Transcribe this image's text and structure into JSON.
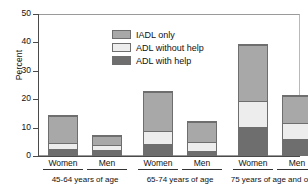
{
  "chart_data": {
    "type": "bar",
    "subtype": "stacked-grouped-bar",
    "title": "",
    "xlabel": "",
    "ylabel": "Percent",
    "ylim": [
      0,
      50
    ],
    "yticks": [
      0,
      10,
      20,
      30,
      40,
      50
    ],
    "grid": false,
    "legend_position": "upper-left-inside",
    "categories": [
      "Women 45-64 years of age",
      "Men 45-64 years of age",
      "Women 65-74 years of age",
      "Men 65-74 years of age",
      "Women 75 years of age and over",
      "Men 75 years of age and over"
    ],
    "sex_labels": [
      "Women",
      "Men",
      "Women",
      "Men",
      "Women",
      "Men"
    ],
    "group_labels": [
      "45-64 years of age",
      "65-74 years of age",
      "75 years of age and over"
    ],
    "series": [
      {
        "name": "ADL with help",
        "color": "#6e6e6e",
        "values": [
          2.2,
          2.0,
          4.0,
          1.6,
          10.0,
          6.0
        ]
      },
      {
        "name": "ADL without help",
        "color": "#ededed",
        "values": [
          2.3,
          2.0,
          4.7,
          3.4,
          9.5,
          5.8
        ]
      },
      {
        "name": "IADL only",
        "color": "#a8a8a8",
        "values": [
          10.0,
          3.5,
          14.3,
          7.4,
          20.0,
          9.8
        ]
      }
    ],
    "totals": [
      14.5,
      7.5,
      23.0,
      12.4,
      39.5,
      21.6
    ]
  },
  "legend": {
    "items": [
      {
        "label": "IADL only",
        "swatch": "mid"
      },
      {
        "label": "ADL without help",
        "swatch": "light"
      },
      {
        "label": "ADL with help",
        "swatch": "dark"
      }
    ]
  },
  "axis": {
    "y_title": "Percent",
    "y_ticks": [
      "0",
      "10",
      "20",
      "30",
      "40",
      "50"
    ]
  }
}
